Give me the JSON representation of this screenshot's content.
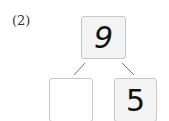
{
  "problem": {
    "label": "(2)",
    "whole": "9",
    "parts": [
      "",
      "5"
    ]
  }
}
